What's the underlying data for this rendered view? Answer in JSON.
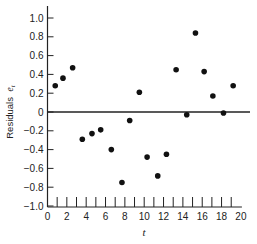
{
  "chart_data": {
    "type": "scatter",
    "title": "",
    "xlabel": "t",
    "ylabel": "Residuals e_t",
    "ylabel_main": "Residuals",
    "ylabel_symbol": "e",
    "ylabel_subscript": "t",
    "xlim": [
      0,
      20
    ],
    "ylim": [
      -1.0,
      1.1
    ],
    "grid": false,
    "legend": null,
    "reference_line": {
      "y": 0
    },
    "x_ticks": [
      0,
      2,
      4,
      6,
      8,
      10,
      12,
      14,
      16,
      18,
      20
    ],
    "x_tick_labels": [
      "0",
      "2",
      "4",
      "6",
      "8",
      "10",
      "12",
      "14",
      "16",
      "18",
      "20"
    ],
    "x_minor_ticks": [
      1,
      2,
      3,
      4,
      5,
      6,
      7,
      8,
      9,
      10,
      11,
      12,
      13,
      14,
      15,
      16,
      17,
      18,
      19
    ],
    "y_ticks": [
      1.0,
      0.8,
      0.6,
      0.4,
      0.2,
      0,
      -0.2,
      -0.4,
      -0.6,
      -0.8,
      -1.0
    ],
    "y_tick_labels": [
      "1.0",
      "0.8",
      "0.6",
      "0.4",
      "0.2",
      "0",
      "−0.2",
      "−0.4",
      "−0.6",
      "−0.8",
      "−1.0"
    ],
    "series": [
      {
        "name": "Residuals",
        "x": [
          0.8,
          1.6,
          2.6,
          3.6,
          4.6,
          5.5,
          6.6,
          7.7,
          8.5,
          9.5,
          10.3,
          11.4,
          12.3,
          13.3,
          14.4,
          15.3,
          16.2,
          17.1,
          18.2,
          19.2
        ],
        "y": [
          0.28,
          0.36,
          0.47,
          -0.29,
          -0.23,
          -0.19,
          -0.4,
          -0.75,
          -0.09,
          0.21,
          -0.48,
          -0.68,
          -0.45,
          0.45,
          -0.03,
          0.84,
          0.43,
          0.17,
          -0.01,
          0.28
        ]
      }
    ]
  },
  "colors": {
    "axis": "#222222",
    "marker": "#111111",
    "background": "#ffffff"
  }
}
